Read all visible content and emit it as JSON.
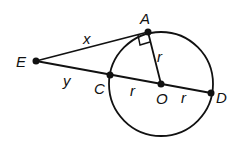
{
  "diagram": {
    "circle": {
      "center": "O",
      "radius_label": "r"
    },
    "points": [
      {
        "name": "E",
        "label": "E",
        "x": 36,
        "y": 61
      },
      {
        "name": "A",
        "label": "A",
        "x": 148,
        "y": 32
      },
      {
        "name": "C",
        "label": "C",
        "x": 110,
        "y": 77
      },
      {
        "name": "O",
        "label": "O",
        "x": 161,
        "y": 84
      },
      {
        "name": "D",
        "label": "D",
        "x": 211,
        "y": 93
      }
    ],
    "segment_labels": {
      "EA": "x",
      "EC": "y",
      "AO": "r",
      "CO": "r",
      "OD": "r"
    },
    "right_angle_at": "A"
  }
}
